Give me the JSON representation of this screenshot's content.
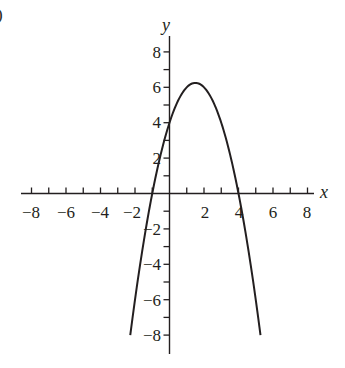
{
  "panel_label": ")",
  "chart_data": {
    "type": "line",
    "title": "",
    "function": "y = -x^2 + 3x + 4",
    "xlabel": "x",
    "ylabel": "y",
    "xlim": [
      -8,
      8
    ],
    "ylim": [
      -8,
      8
    ],
    "grid": false,
    "legend": null,
    "x_ticks": [
      -8,
      -7,
      -6,
      -5,
      -4,
      -3,
      -2,
      -1,
      1,
      2,
      3,
      4,
      5,
      6,
      7,
      8
    ],
    "y_ticks": [
      -8,
      -7,
      -6,
      -5,
      -4,
      -3,
      -2,
      -1,
      1,
      2,
      3,
      4,
      5,
      6,
      7,
      8
    ],
    "x_tick_labels": [
      "-8",
      "-6",
      "-4",
      "-2",
      "2",
      "4",
      "6",
      "8"
    ],
    "y_tick_labels": [
      "8",
      "6",
      "4",
      "2",
      "-2",
      "-4",
      "-6",
      "-8"
    ],
    "series": [
      {
        "name": "parabola",
        "x_range": [
          -2.275,
          5.275
        ],
        "vertex": [
          1.5,
          6.25
        ],
        "roots": [
          -1,
          4
        ],
        "y_intercept": 4,
        "x": [
          -2.275,
          -2,
          -1.5,
          -1,
          -0.5,
          0,
          0.5,
          1,
          1.5,
          2,
          2.5,
          3,
          3.5,
          4,
          4.5,
          5,
          5.275
        ],
        "y": [
          -8.0,
          -6.0,
          -2.75,
          0,
          2.25,
          4,
          5.25,
          6,
          6.25,
          6,
          5.25,
          4,
          2.25,
          0,
          -2.75,
          -6,
          -8.0
        ]
      }
    ]
  },
  "x_tick_text": {
    "neg8": "−8",
    "neg6": "−6",
    "neg4": "−4",
    "neg2": "−2",
    "pos2": "2",
    "pos4": "4",
    "pos6": "6",
    "pos8": "8"
  },
  "y_tick_text": {
    "pos8": "8",
    "pos6": "6",
    "pos4": "4",
    "pos2": "2",
    "neg2": "−2",
    "neg4": "−4",
    "neg6": "−6",
    "neg8": "−8"
  },
  "colors": {
    "ink": "#231f20",
    "background": "#ffffff"
  }
}
